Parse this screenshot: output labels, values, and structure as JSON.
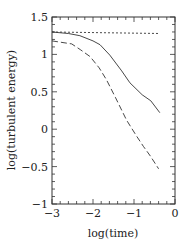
{
  "chart_data": {
    "type": "line",
    "title": "",
    "xlabel": "log(time)",
    "ylabel": "log(turbulent energy)",
    "xlim": [
      -3,
      0
    ],
    "ylim": [
      -1,
      1.5
    ],
    "x_ticks": [
      -3,
      -2,
      -1,
      0
    ],
    "x_tick_labels": [
      "−3",
      "−2",
      "−1",
      "0"
    ],
    "y_ticks": [
      -1,
      -0.5,
      0,
      0.5,
      1,
      1.5
    ],
    "y_tick_labels": [
      "−1",
      "−0.5",
      "0",
      "0.5",
      "1",
      "1.5"
    ],
    "x_minor_step": 0.2,
    "y_minor_step": 0.1,
    "grid": false,
    "legend": null,
    "series": [
      {
        "name": "solid",
        "style": "solid",
        "x": [
          -3.0,
          -2.6,
          -2.32,
          -2.0,
          -1.83,
          -1.59,
          -1.3,
          -1.1,
          -0.8,
          -0.59,
          -0.37
        ],
        "y": [
          1.3,
          1.28,
          1.25,
          1.18,
          1.13,
          0.99,
          0.78,
          0.62,
          0.46,
          0.38,
          0.22
        ]
      },
      {
        "name": "dashed",
        "style": "dashed",
        "x": [
          -3.0,
          -2.52,
          -2.3,
          -2.07,
          -1.85,
          -1.67,
          -1.45,
          -1.18,
          -0.95,
          -0.77,
          -0.6,
          -0.4
        ],
        "y": [
          1.18,
          1.14,
          1.06,
          0.97,
          0.82,
          0.66,
          0.42,
          0.12,
          -0.08,
          -0.23,
          -0.36,
          -0.53
        ]
      },
      {
        "name": "dotted",
        "style": "dotted",
        "x": [
          -3.0,
          -0.37
        ],
        "y": [
          1.3,
          1.28
        ]
      }
    ]
  }
}
